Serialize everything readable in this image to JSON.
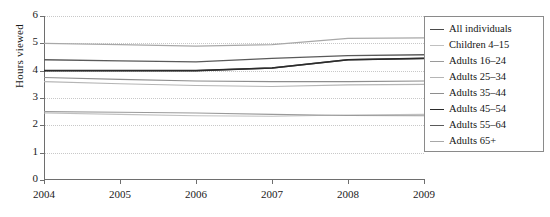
{
  "chart_data": {
    "type": "line",
    "title": "",
    "xlabel": "",
    "ylabel": "Hours viewed",
    "x": [
      2004,
      2005,
      2006,
      2007,
      2008,
      2009
    ],
    "xtick_labels": [
      "2004",
      "2005",
      "2006",
      "2007",
      "2008",
      "2009"
    ],
    "ytick_labels": [
      "0",
      "1",
      "2",
      "3",
      "4",
      "5",
      "6"
    ],
    "yticks": [
      0,
      1,
      2,
      3,
      4,
      5,
      6
    ],
    "ylim": [
      0,
      6
    ],
    "xlim": [
      2004,
      2009
    ],
    "grid": "horizontal-dotted",
    "legend_position": "right-outside",
    "series": [
      {
        "name": "All individuals",
        "color": "#4a4a4a",
        "width": 1.4,
        "values": [
          4.0,
          4.0,
          4.0,
          4.1,
          4.4,
          4.45
        ]
      },
      {
        "name": "Children 4–15",
        "color": "#c0c0c0",
        "width": 1.1,
        "values": [
          2.45,
          2.4,
          2.35,
          2.33,
          2.38,
          2.4
        ]
      },
      {
        "name": "Adults 16–24",
        "color": "#9a9a9a",
        "width": 1.1,
        "values": [
          2.5,
          2.48,
          2.45,
          2.4,
          2.36,
          2.35
        ]
      },
      {
        "name": "Adults 25–34",
        "color": "#b5b5b5",
        "width": 1.1,
        "values": [
          3.6,
          3.52,
          3.46,
          3.42,
          3.48,
          3.5
        ]
      },
      {
        "name": "Adults 35–44",
        "color": "#8e8e8e",
        "width": 1.1,
        "values": [
          3.75,
          3.68,
          3.62,
          3.6,
          3.6,
          3.62
        ]
      },
      {
        "name": "Adults 45–54",
        "color": "#2b2b2b",
        "width": 1.6,
        "values": [
          4.0,
          4.0,
          4.0,
          4.1,
          4.4,
          4.45
        ]
      },
      {
        "name": "Adults 55–64",
        "color": "#5a5a5a",
        "width": 1.4,
        "values": [
          4.4,
          4.36,
          4.32,
          4.45,
          4.55,
          4.58
        ]
      },
      {
        "name": "Adults 65+",
        "color": "#a8a8a8",
        "width": 1.2,
        "values": [
          5.0,
          4.95,
          4.9,
          4.95,
          5.18,
          5.2
        ]
      }
    ]
  },
  "axis": {
    "y_title": "Hours viewed"
  }
}
